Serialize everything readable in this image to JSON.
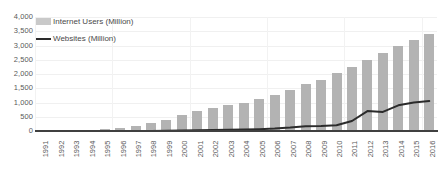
{
  "chart_data": {
    "type": "bar",
    "title": "",
    "subtitle": "",
    "xlabel": "",
    "ylabel": "",
    "ylim": [
      0,
      4000
    ],
    "y_ticks": [
      "0",
      "500",
      "1,000",
      "1,500",
      "2,000",
      "2,500",
      "3,000",
      "3,500",
      "4,000"
    ],
    "y_tick_values": [
      0,
      500,
      1000,
      1500,
      2000,
      2500,
      3000,
      3500,
      4000
    ],
    "grid": true,
    "legend_position": "top-left",
    "categories": [
      "1991",
      "1992",
      "1993",
      "1994",
      "1995",
      "1996",
      "1997",
      "1998",
      "1999",
      "2000",
      "2001",
      "2002",
      "2003",
      "2004",
      "2005",
      "2006",
      "2007",
      "2008",
      "2009",
      "2010",
      "2011",
      "2012",
      "2013",
      "2014",
      "2015",
      "2016"
    ],
    "series": [
      {
        "name": "Internet Users (Million)",
        "type": "bar",
        "color": "#b3b3b3",
        "values": [
          4,
          12,
          25,
          45,
          80,
          120,
          180,
          280,
          400,
          560,
          700,
          800,
          900,
          1000,
          1120,
          1250,
          1450,
          1650,
          1800,
          2050,
          2250,
          2500,
          2750,
          3000,
          3200,
          3400
        ]
      },
      {
        "name": "Websites (Million)",
        "type": "line",
        "color": "#2b2b2b",
        "values": [
          0,
          0,
          0,
          0,
          0,
          1,
          2,
          3,
          5,
          17,
          30,
          38,
          40,
          52,
          65,
          85,
          120,
          170,
          175,
          200,
          350,
          700,
          670,
          900,
          1000,
          1050
        ]
      }
    ]
  },
  "legend": {
    "entries": [
      {
        "label": "Internet Users (Million)",
        "marker": "bar-swatch-icon"
      },
      {
        "label": "Websites (Million)",
        "marker": "line-swatch-icon"
      }
    ]
  }
}
